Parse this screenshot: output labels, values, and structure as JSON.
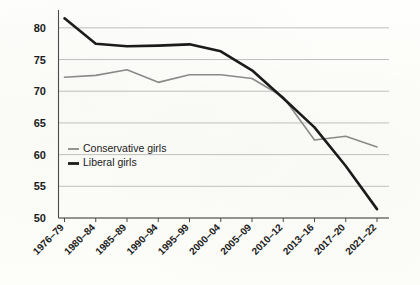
{
  "chart_data": {
    "type": "line",
    "title": "",
    "subtitle": "",
    "xlabel": "",
    "ylabel": "",
    "grid": true,
    "legend_position": "inside-left",
    "ylim": [
      50,
      82.5
    ],
    "yticks": [
      50,
      55,
      60,
      65,
      70,
      75,
      80
    ],
    "ytick_labels": [
      "50",
      "55",
      "60",
      "65",
      "70",
      "75",
      "80"
    ],
    "categories": [
      "1976–79",
      "1980–84",
      "1985–89",
      "1990–94",
      "1995–99",
      "2000–04",
      "2005–09",
      "2010–12",
      "2013–16",
      "2017–20",
      "2021–22"
    ],
    "series": [
      {
        "name": "Conservative girls",
        "color": "#8a8a8a",
        "width": 1.6,
        "values": [
          72.2,
          72.5,
          73.4,
          71.4,
          72.6,
          72.6,
          72.0,
          69.1,
          62.3,
          62.9,
          61.2
        ]
      },
      {
        "name": "Liberal girls",
        "color": "#1b1b1b",
        "width": 2.6,
        "values": [
          81.5,
          77.5,
          77.1,
          77.2,
          77.4,
          76.3,
          73.3,
          68.9,
          64.3,
          58.2,
          51.4
        ]
      }
    ]
  },
  "legend": {
    "items": [
      {
        "label": "Conservative girls",
        "color": "#8a8a8a",
        "width": 1.8
      },
      {
        "label": "Liberal girls",
        "color": "#1b1b1b",
        "width": 2.8
      }
    ]
  },
  "axes": {
    "gridline_color": "#b9b9b9",
    "axis_color": "#4a4a4a"
  }
}
